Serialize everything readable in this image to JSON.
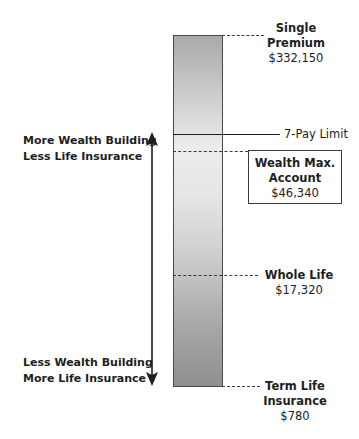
{
  "diagram": {
    "bar_label_top": {
      "title": "Single\nPremium",
      "line1": "Single",
      "line2": "Premium",
      "value": "$332,150"
    },
    "limit_label": "7-Pay Limit",
    "wealth_max": {
      "line1": "Wealth Max.",
      "line2": "Account",
      "value": "$46,340"
    },
    "whole_life": {
      "title": "Whole Life",
      "value": "$17,320"
    },
    "term_life": {
      "line1": "Term Life",
      "line2": "Insurance",
      "value": "$780"
    },
    "arrow_top_text": {
      "line1": "More Wealth Building",
      "line2": "Less Life Insurance"
    },
    "arrow_bottom_text": {
      "line1": "Less Wealth Building",
      "line2": "More Life Insurance"
    },
    "colors": {
      "ink": "#1e1e1e",
      "bar_dark": "#8f8f8f",
      "bar_light": "#ececec"
    }
  }
}
